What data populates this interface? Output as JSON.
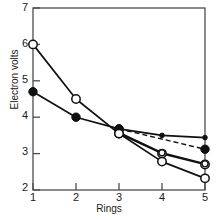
{
  "chart_data": {
    "type": "line",
    "title": "",
    "xlabel": "Rings",
    "ylabel": "Electron volts",
    "x": [
      1,
      2,
      3,
      4,
      5
    ],
    "xlim": [
      1,
      5
    ],
    "ylim": [
      2,
      7
    ],
    "xticks": [
      "1",
      "2",
      "3",
      "4",
      "5"
    ],
    "yticks": [
      "2",
      "3",
      "4",
      "5",
      "6",
      "7"
    ],
    "grid": false,
    "legend": "none",
    "series": [
      {
        "name": "series-open-large",
        "marker": "open-circle-large",
        "linestyle": "solid",
        "values": [
          6.0,
          4.5,
          3.55,
          3.0,
          2.7
        ]
      },
      {
        "name": "series-filled-large",
        "marker": "filled-circle-large",
        "linestyle": "solid",
        "values": [
          4.7,
          4.0,
          3.68,
          null,
          null
        ]
      },
      {
        "name": "series-filled-small",
        "marker": "filled-dot-small",
        "linestyle": "solid",
        "values": [
          null,
          null,
          3.68,
          3.5,
          3.44
        ]
      },
      {
        "name": "series-dashed",
        "marker": "filled-circle-large",
        "linestyle": "dashed",
        "values": [
          null,
          null,
          3.68,
          null,
          3.12
        ]
      },
      {
        "name": "series-open-small",
        "marker": "open-circle-small",
        "linestyle": "solid",
        "values": [
          null,
          null,
          3.58,
          3.02,
          2.72
        ]
      },
      {
        "name": "series-open-lowest",
        "marker": "open-circle-large",
        "linestyle": "solid",
        "values": [
          null,
          null,
          3.55,
          2.78,
          2.32
        ]
      }
    ]
  },
  "axis": {
    "y_tick_labels": [
      "7",
      "6",
      "5",
      "4",
      "3",
      "2"
    ],
    "x_tick_labels": [
      "1",
      "2",
      "3",
      "4",
      "5"
    ],
    "y_title": "Electron volts",
    "x_title": "Rings"
  }
}
